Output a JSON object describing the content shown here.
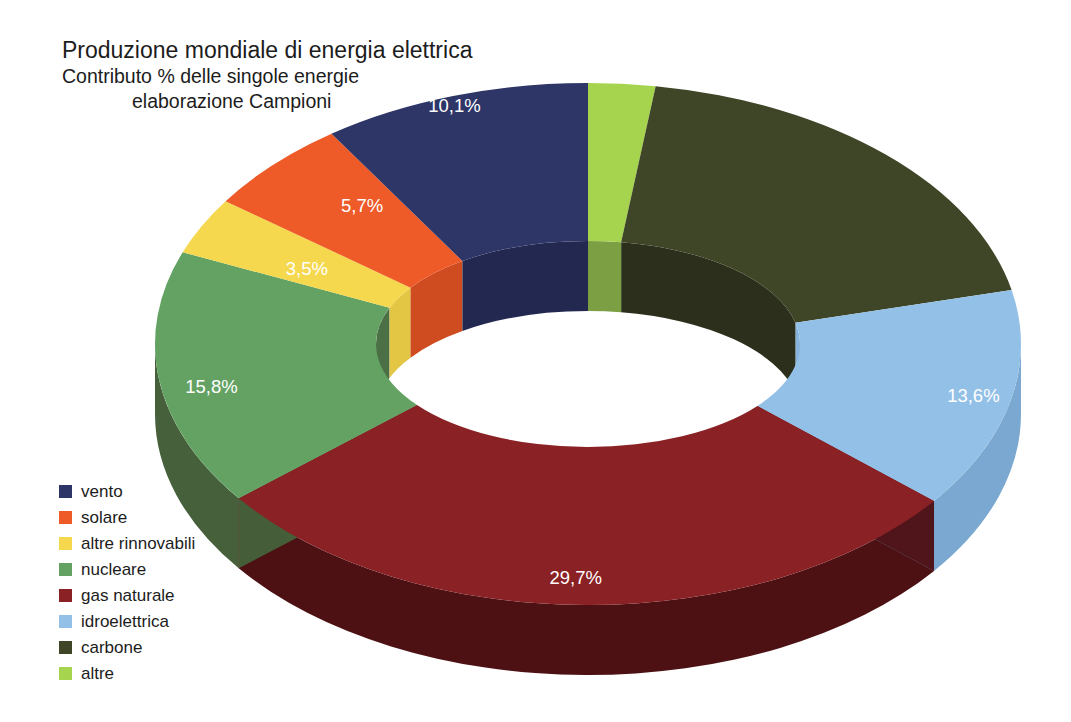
{
  "chart_data": {
    "type": "pie",
    "variant": "donut-3d",
    "title": "Produzione mondiale di energia elettrica",
    "subtitle_line_1": "Contributo % delle singole energie",
    "subtitle_line_2": "elaborazione Campioni",
    "xlabel": "",
    "ylabel": "",
    "units": "%",
    "decimal_separator": ",",
    "legend_position": "bottom-left",
    "grid": false,
    "total": 100.1,
    "start_angle_deg": -90,
    "direction": "clockwise",
    "categories": [
      "altre",
      "carbone",
      "idroelettrica",
      "gas naturale",
      "nucleare",
      "altre rinnovabili",
      "solare",
      "vento"
    ],
    "values": [
      2.5,
      19.2,
      13.6,
      29.7,
      15.8,
      3.5,
      5.7,
      10.1
    ],
    "labels": [
      "2,5%",
      "19,2%",
      "13,6%",
      "29,7%",
      "15,8%",
      "3,5%",
      "5,7%",
      "10,1%"
    ],
    "colors": [
      "#a6d44f",
      "#3f4527",
      "#93c0e6",
      "#8a2125",
      "#63a263",
      "#f5d84e",
      "#ee5a28",
      "#2e3567"
    ],
    "slices": [
      {
        "name": "altre",
        "value": 2.5,
        "label": "2,5%",
        "color": "#a6d44f",
        "side_color": "#6c8f39",
        "inner_color": "#7c9f44"
      },
      {
        "name": "carbone",
        "value": 19.2,
        "label": "19,2%",
        "color": "#3f4527",
        "side_color": "#262b17",
        "inner_color": "#2b2f1b"
      },
      {
        "name": "idroelettrica",
        "value": 13.6,
        "label": "13,6%",
        "color": "#93c0e6",
        "side_color": "#7aa8d0",
        "inner_color": "#86b3db"
      },
      {
        "name": "gas naturale",
        "value": 29.7,
        "label": "29,7%",
        "color": "#8a2125",
        "side_color": "#4d1114",
        "inner_color": "#5c1518"
      },
      {
        "name": "nucleare",
        "value": 15.8,
        "label": "15,8%",
        "color": "#63a263",
        "side_color": "#45603a",
        "inner_color": "#4b7046"
      },
      {
        "name": "altre rinnovabili",
        "value": 3.5,
        "label": "3,5%",
        "color": "#f5d84e",
        "side_color": "#d9bc3d",
        "inner_color": "#e3c644"
      },
      {
        "name": "solare",
        "value": 5.7,
        "label": "5,7%",
        "color": "#ee5a28",
        "side_color": "#c2431c",
        "inner_color": "#cf4c20"
      },
      {
        "name": "vento",
        "value": 10.1,
        "label": "10,1%",
        "color": "#2e3567",
        "side_color": "#1d2244",
        "inner_color": "#232850"
      }
    ]
  },
  "legend": {
    "items": [
      {
        "label": "vento",
        "color": "#2e3567"
      },
      {
        "label": "solare",
        "color": "#ee5a28"
      },
      {
        "label": "altre rinnovabili",
        "color": "#f5d84e"
      },
      {
        "label": "nucleare",
        "color": "#63a263"
      },
      {
        "label": "gas naturale",
        "color": "#8a2125"
      },
      {
        "label": "idroelettrica",
        "color": "#93c0e6"
      },
      {
        "label": "carbone",
        "color": "#3f4527"
      },
      {
        "label": "altre",
        "color": "#a6d44f"
      }
    ]
  },
  "canvas": {
    "background": "#ffffff",
    "label_text_color": "#ffffff",
    "title_text_color": "#1c1c1c"
  }
}
